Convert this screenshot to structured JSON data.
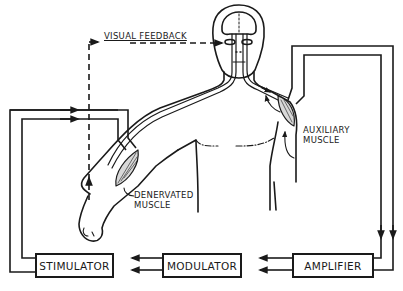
{
  "diagram": {
    "title": "",
    "labels": {
      "visual_feedback": "VISUAL FEEDBACK",
      "auxiliary_muscle_line1": "AUXILIARY",
      "auxiliary_muscle_line2": "MUSCLE",
      "denervated_muscle_line1": "DENERVATED",
      "denervated_muscle_line2": "MUSCLE"
    },
    "blocks": [
      {
        "id": "stimulator",
        "label": "STIMULATOR"
      },
      {
        "id": "modulator",
        "label": "MODULATOR"
      },
      {
        "id": "amplifier",
        "label": "AMPLIFIER"
      }
    ],
    "signal_flow": [
      "auxiliary muscle",
      "amplifier",
      "modulator",
      "stimulator",
      "denervated muscle"
    ],
    "feedback_path": {
      "from": "denervated muscle / arm",
      "to": "eyes",
      "style": "dashed",
      "label": "VISUAL FEEDBACK"
    },
    "colors": {
      "ink": "#1a1a1a",
      "background": "#ffffff",
      "muscle_fill": "#d8d8d8"
    }
  }
}
